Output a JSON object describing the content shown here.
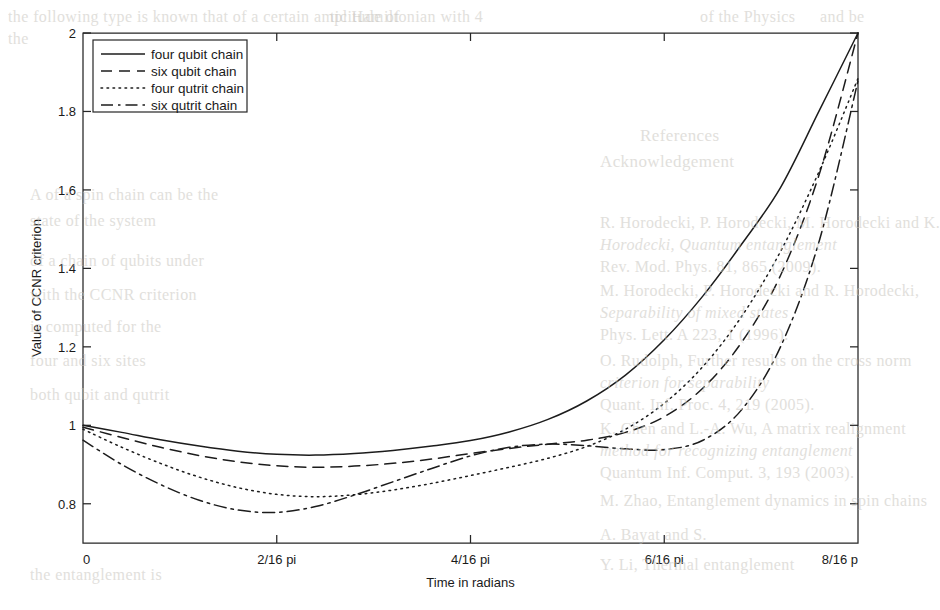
{
  "figure": {
    "background_color": "#ffffff",
    "ink_color": "#1c1c1c",
    "scan_bleed_color": "#c9c6c0"
  },
  "chart_data": {
    "type": "line",
    "title": "",
    "xlabel": "Time in radians",
    "ylabel": "Value of CCNR criterion",
    "xlim": [
      0,
      8
    ],
    "ylim": [
      0.7,
      2
    ],
    "grid": false,
    "legend_position": "upper left",
    "xtick_values": [
      0,
      2,
      4,
      6,
      8
    ],
    "xtick_labels": [
      "0",
      "2/16 pi",
      "4/16 pi",
      "6/16 pi",
      "8/16 p"
    ],
    "ytick_values": [
      0.8,
      1,
      1.2,
      1.4,
      1.6,
      1.8,
      2
    ],
    "ytick_labels": [
      "0.8",
      "1",
      "1.2",
      "1.4",
      "1.6",
      "1.8",
      "2"
    ],
    "x": [
      0,
      0.4,
      0.8,
      1.2,
      1.6,
      2.0,
      2.4,
      2.8,
      3.2,
      3.6,
      4.0,
      4.4,
      4.8,
      5.2,
      5.6,
      6.0,
      6.4,
      6.8,
      7.2,
      7.6,
      8.0
    ],
    "series": [
      {
        "name": "four qubit chain",
        "dash_style": "solid",
        "dash_array": "none",
        "values": [
          1.0,
          0.982,
          0.963,
          0.947,
          0.934,
          0.926,
          0.924,
          0.928,
          0.936,
          0.947,
          0.961,
          0.983,
          1.015,
          1.062,
          1.128,
          1.218,
          1.33,
          1.462,
          1.606,
          1.802,
          2.0
        ]
      },
      {
        "name": "six qubit chain",
        "dash_style": "dashed",
        "dash_array": "11,7",
        "values": [
          0.995,
          0.969,
          0.944,
          0.923,
          0.907,
          0.897,
          0.893,
          0.896,
          0.903,
          0.914,
          0.928,
          0.941,
          0.952,
          0.962,
          0.982,
          1.022,
          1.095,
          1.212,
          1.382,
          1.64,
          2.0
        ]
      },
      {
        "name": "four qutrit chain",
        "dash_style": "dotted",
        "dash_array": "1.6,4.4",
        "values": [
          0.99,
          0.944,
          0.903,
          0.868,
          0.841,
          0.824,
          0.818,
          0.823,
          0.835,
          0.852,
          0.872,
          0.893,
          0.916,
          0.946,
          0.99,
          1.056,
          1.15,
          1.278,
          1.443,
          1.648,
          1.884
        ]
      },
      {
        "name": "six qutrit chain",
        "dash_style": "dashdot",
        "dash_array": "12,5,2.5,5",
        "values": [
          0.962,
          0.9,
          0.849,
          0.809,
          0.784,
          0.778,
          0.793,
          0.822,
          0.856,
          0.89,
          0.922,
          0.944,
          0.952,
          0.948,
          0.94,
          0.938,
          0.962,
          1.04,
          1.2,
          1.47,
          1.878
        ]
      }
    ]
  },
  "scan_bleed_lines": [
    {
      "text": "the following type is known that   of a certain amplitude of",
      "x": 8,
      "y": 8,
      "size": 16,
      "italic": false
    },
    {
      "text": "the",
      "x": 8,
      "y": 30,
      "size": 16,
      "italic": false
    },
    {
      "text": "tic Hamiltonian with  4",
      "x": 330,
      "y": 8,
      "size": 16,
      "italic": false
    },
    {
      "text": "of the   Physics",
      "x": 700,
      "y": 8,
      "size": 16,
      "italic": false
    },
    {
      "text": "and be",
      "x": 820,
      "y": 8,
      "size": 16,
      "italic": false
    },
    {
      "text": "References",
      "x": 640,
      "y": 126,
      "size": 17,
      "italic": false
    },
    {
      "text": "R. Horodecki, P. Horodecki, M. Horodecki and K.",
      "x": 600,
      "y": 214,
      "size": 16,
      "italic": false
    },
    {
      "text": "Horodecki, Quantum entanglement",
      "x": 600,
      "y": 236,
      "size": 16,
      "italic": true
    },
    {
      "text": "Rev. Mod. Phys. 81, 865 (2009).",
      "x": 600,
      "y": 258,
      "size": 16,
      "italic": false
    },
    {
      "text": "M. Horodecki, P. Horodecki and R. Horodecki,",
      "x": 600,
      "y": 282,
      "size": 16,
      "italic": false
    },
    {
      "text": "Separability of mixed states",
      "x": 600,
      "y": 304,
      "size": 16,
      "italic": true
    },
    {
      "text": "Phys. Lett. A 223, 1 (1996).",
      "x": 600,
      "y": 326,
      "size": 16,
      "italic": false
    },
    {
      "text": "O. Rudolph, Further results on the cross norm",
      "x": 600,
      "y": 352,
      "size": 16,
      "italic": false
    },
    {
      "text": "criterion for separability",
      "x": 600,
      "y": 374,
      "size": 16,
      "italic": true
    },
    {
      "text": "Quant. Inf. Proc. 4, 219 (2005).",
      "x": 600,
      "y": 396,
      "size": 16,
      "italic": false
    },
    {
      "text": "K. Chen and L.-A. Wu, A matrix realignment",
      "x": 600,
      "y": 420,
      "size": 16,
      "italic": false
    },
    {
      "text": "method for recognizing entanglement",
      "x": 600,
      "y": 442,
      "size": 16,
      "italic": true
    },
    {
      "text": "Quantum Inf. Comput. 3, 193 (2003).",
      "x": 600,
      "y": 464,
      "size": 16,
      "italic": false
    },
    {
      "text": "M. Zhao, Entanglement dynamics in spin chains",
      "x": 600,
      "y": 492,
      "size": 16,
      "italic": false
    },
    {
      "text": "A. Bayat and S.",
      "x": 600,
      "y": 526,
      "size": 16,
      "italic": false
    },
    {
      "text": "Y. Li, Thermal entanglement",
      "x": 600,
      "y": 556,
      "size": 16,
      "italic": false
    },
    {
      "text": "A   of a spin chain can be     the",
      "x": 30,
      "y": 186,
      "size": 16,
      "italic": false
    },
    {
      "text": "state of the system",
      "x": 30,
      "y": 212,
      "size": 16,
      "italic": false
    },
    {
      "text": "of a chain of qubits under",
      "x": 30,
      "y": 252,
      "size": 16,
      "italic": false
    },
    {
      "text": "with the CCNR criterion",
      "x": 30,
      "y": 286,
      "size": 16,
      "italic": false
    },
    {
      "text": "is computed for the",
      "x": 30,
      "y": 318,
      "size": 16,
      "italic": false
    },
    {
      "text": "four and six sites",
      "x": 30,
      "y": 352,
      "size": 16,
      "italic": false
    },
    {
      "text": "both qubit and qutrit",
      "x": 30,
      "y": 386,
      "size": 16,
      "italic": false
    },
    {
      "text": "the entanglement is",
      "x": 30,
      "y": 566,
      "size": 16,
      "italic": false
    },
    {
      "text": "Acknowledgement",
      "x": 600,
      "y": 152,
      "size": 17,
      "italic": false
    }
  ]
}
